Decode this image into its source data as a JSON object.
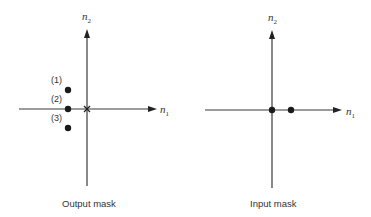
{
  "panels": [
    {
      "id": "output-mask",
      "caption": "Output mask",
      "axes": {
        "x_label": "n",
        "x_sub": "1",
        "y_label": "n",
        "y_sub": "2"
      },
      "origin_marker": "x-mark",
      "points": [
        {
          "label": "(1)",
          "n1": -1,
          "n2": 1
        },
        {
          "label": "(2)",
          "n1": -1,
          "n2": 0
        },
        {
          "label": "(3)",
          "n1": -1,
          "n2": -1
        }
      ]
    },
    {
      "id": "input-mask",
      "caption": "Input mask",
      "axes": {
        "x_label": "n",
        "x_sub": "1",
        "y_label": "n",
        "y_sub": "2"
      },
      "origin_marker": "dot",
      "points": [
        {
          "label": "",
          "n1": 0,
          "n2": 0
        },
        {
          "label": "",
          "n1": 1,
          "n2": 0
        }
      ]
    }
  ]
}
